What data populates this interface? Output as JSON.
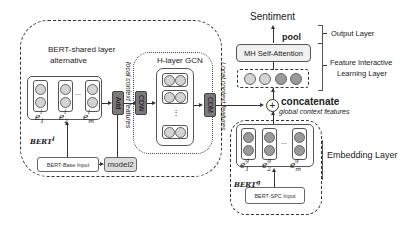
{
  "diagram": {
    "left_module": {
      "title_line1": "BERT-shared layer",
      "title_line2": "alternative",
      "bert_local_label": "BERT",
      "bert_local_sup": "l",
      "embeddings": [
        {
          "base": "e",
          "sub": "1",
          "sup": "l"
        },
        {
          "base": "e",
          "sub": "2",
          "sup": "l"
        },
        {
          "base": "e",
          "sub": "m",
          "sup": "l"
        }
      ],
      "ellipsis": "...",
      "input_label": "BERT-Base Input",
      "model2_label": "model2",
      "add_label": "Add",
      "cdw_label": "CDW",
      "cdm_label": "CDM",
      "local_context_label_1": "local context features",
      "local_context_label_2": "Local context features"
    },
    "gcn": {
      "title": "H-layer GCN",
      "ellipsis": "⋮"
    },
    "right_module": {
      "sentiment_label": "Sentiment",
      "pool_label": "pool",
      "attention_label": "MH Self-Attention",
      "concat_symbol": "+",
      "concat_label": "concatenate",
      "global_context_label": "global context features",
      "bert_global_label": "BERT",
      "bert_global_sup": "g",
      "embeddings": [
        {
          "base": "e",
          "sub": "1",
          "sup": "g"
        },
        {
          "base": "e",
          "sub": "2",
          "sup": "g"
        },
        {
          "base": "e",
          "sub": "m",
          "sup": "g"
        }
      ],
      "ellipsis": "...",
      "input_label": "BERT-SPC Input"
    },
    "layers": {
      "output_layer": "Output Layer",
      "feature_layer_line1": "Feature Interactive",
      "feature_layer_line2": "Learning Layer",
      "embedding_layer": "Embedding Layer"
    }
  }
}
